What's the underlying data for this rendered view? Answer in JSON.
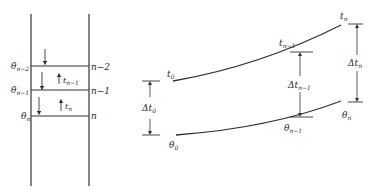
{
  "left_diagram": {
    "levels": [
      {
        "theta_label": "θ",
        "theta_sub": "n−2",
        "right_label": "n−2"
      },
      {
        "theta_label": "θ",
        "theta_sub": "n−1",
        "right_label": "n−1"
      },
      {
        "theta_label": "θ",
        "theta_sub": "n",
        "right_label": "n"
      }
    ],
    "flow_labels": [
      {
        "main": "t",
        "sub": "n−1"
      },
      {
        "main": "t",
        "sub": "n"
      }
    ]
  },
  "right_diagram": {
    "upper_curve": {
      "start": {
        "main": "t",
        "sub": "0"
      },
      "mid": {
        "main": "t",
        "sub": "n−1"
      },
      "end": {
        "main": "t",
        "sub": "n"
      }
    },
    "lower_curve": {
      "start": {
        "main": "θ",
        "sub": "0"
      },
      "mid": {
        "main": "θ",
        "sub": "n−1"
      },
      "end": {
        "main": "θ",
        "sub": "n"
      }
    },
    "differences": [
      {
        "main": "Δt",
        "sub": "0"
      },
      {
        "main": "Δt",
        "sub": "n−1"
      },
      {
        "main": "Δt",
        "sub": "n"
      }
    ]
  }
}
